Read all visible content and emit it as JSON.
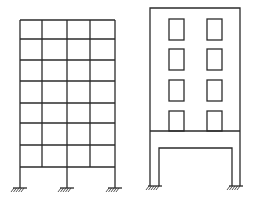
{
  "diagram": {
    "type": "structural-frame-comparison",
    "colors": {
      "stroke": "#2b2b2b",
      "background": "#ffffff"
    },
    "frames": [
      {
        "name": "rigid-frame-grid",
        "description": "7-story, 4-bay moment frame with fixed supports",
        "stories": 7,
        "bays": 4,
        "column_x": [
          20,
          42,
          67,
          90,
          115
        ],
        "floor_y": [
          20,
          39,
          60,
          81,
          103,
          123,
          145,
          167
        ],
        "ground_y": 188,
        "supports_x": [
          20,
          67,
          115
        ]
      },
      {
        "name": "building-on-portal-frame",
        "description": "Wall building with window openings sitting on a transfer beam over a portal frame",
        "outer": {
          "x": 150,
          "y": 8,
          "w": 90,
          "h": 178
        },
        "windows": [
          {
            "x": 169,
            "y": 19,
            "w": 15,
            "h": 21
          },
          {
            "x": 207,
            "y": 19,
            "w": 15,
            "h": 21
          },
          {
            "x": 169,
            "y": 49,
            "w": 15,
            "h": 21
          },
          {
            "x": 207,
            "y": 49,
            "w": 15,
            "h": 21
          },
          {
            "x": 169,
            "y": 80,
            "w": 15,
            "h": 21
          },
          {
            "x": 207,
            "y": 80,
            "w": 15,
            "h": 21
          },
          {
            "x": 169,
            "y": 111,
            "w": 15,
            "h": 20
          },
          {
            "x": 207,
            "y": 111,
            "w": 15,
            "h": 20
          }
        ],
        "transfer_beam_y": 131,
        "portal_inner": {
          "left_x": 159,
          "right_x": 232,
          "top_y": 148
        },
        "ground_y": 186,
        "supports_x": [
          155,
          236
        ]
      }
    ]
  }
}
